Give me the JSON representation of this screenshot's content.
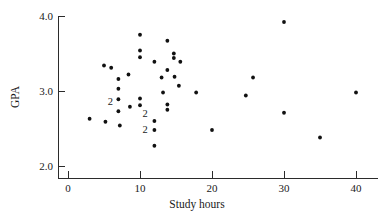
{
  "chart_data": {
    "type": "scatter",
    "title": "",
    "xlabel": "Study hours",
    "ylabel": "GPA",
    "xlim": [
      -1.2,
      42.5
    ],
    "ylim": [
      1.82,
      4.06
    ],
    "grid": false,
    "legend": null,
    "xticks": [
      0,
      10,
      20,
      30,
      40
    ],
    "xticklabels": [
      "0",
      "10",
      "20",
      "30",
      "40"
    ],
    "yticks": [
      2.0,
      3.0,
      4.0
    ],
    "yticklabels": [
      "2.0",
      "3.0",
      "4.0"
    ],
    "marker": "filled-circle",
    "marker_color": "#111111",
    "points": [
      {
        "x": 3.0,
        "y": 2.63
      },
      {
        "x": 5.0,
        "y": 3.34
      },
      {
        "x": 5.2,
        "y": 2.59
      },
      {
        "x": 6.0,
        "y": 3.31
      },
      {
        "x": 7.0,
        "y": 3.16
      },
      {
        "x": 7.0,
        "y": 3.03
      },
      {
        "x": 7.0,
        "y": 2.89
      },
      {
        "x": 7.0,
        "y": 2.73
      },
      {
        "x": 7.2,
        "y": 2.54
      },
      {
        "x": 8.4,
        "y": 3.22
      },
      {
        "x": 8.6,
        "y": 2.79
      },
      {
        "x": 10.0,
        "y": 3.75
      },
      {
        "x": 10.0,
        "y": 3.54
      },
      {
        "x": 10.0,
        "y": 3.45
      },
      {
        "x": 10.0,
        "y": 2.9
      },
      {
        "x": 10.0,
        "y": 2.81
      },
      {
        "x": 12.0,
        "y": 3.39
      },
      {
        "x": 12.0,
        "y": 2.6
      },
      {
        "x": 12.0,
        "y": 2.48
      },
      {
        "x": 12.0,
        "y": 2.27
      },
      {
        "x": 13.0,
        "y": 3.18
      },
      {
        "x": 13.2,
        "y": 2.98
      },
      {
        "x": 13.8,
        "y": 3.67
      },
      {
        "x": 13.8,
        "y": 3.28
      },
      {
        "x": 13.8,
        "y": 2.82
      },
      {
        "x": 13.8,
        "y": 2.75
      },
      {
        "x": 14.7,
        "y": 3.5
      },
      {
        "x": 14.7,
        "y": 3.44
      },
      {
        "x": 14.8,
        "y": 3.19
      },
      {
        "x": 15.6,
        "y": 3.39
      },
      {
        "x": 15.4,
        "y": 3.07
      },
      {
        "x": 17.8,
        "y": 2.98
      },
      {
        "x": 20.0,
        "y": 2.48
      },
      {
        "x": 24.7,
        "y": 2.94
      },
      {
        "x": 25.7,
        "y": 3.18
      },
      {
        "x": 30.0,
        "y": 3.92
      },
      {
        "x": 30.0,
        "y": 2.71
      },
      {
        "x": 35.0,
        "y": 2.38
      },
      {
        "x": 40.0,
        "y": 2.98
      }
    ],
    "overlap_labels": [
      {
        "text": "2",
        "x": 5.9,
        "y": 2.86
      },
      {
        "text": "2",
        "x": 10.7,
        "y": 2.7
      },
      {
        "text": "2",
        "x": 10.7,
        "y": 2.49
      }
    ]
  }
}
